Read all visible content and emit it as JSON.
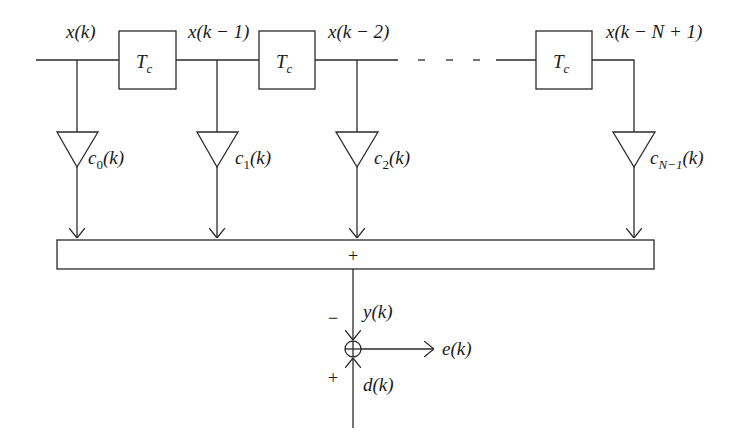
{
  "diagram": {
    "input_label": "x(k)",
    "delay_label": "T",
    "delay_sub": "c",
    "taps": [
      {
        "signal": "x(k)",
        "coef": "c",
        "coef_sub": "0",
        "coef_arg": "(k)"
      },
      {
        "signal": "x(k − 1)",
        "coef": "c",
        "coef_sub": "1",
        "coef_arg": "(k)"
      },
      {
        "signal": "x(k − 2)",
        "coef": "c",
        "coef_sub": "2",
        "coef_arg": "(k)"
      },
      {
        "signal": "x(k − N + 1)",
        "coef": "c",
        "coef_sub": "N−1",
        "coef_arg": "(k)"
      }
    ],
    "adder_label": "+",
    "output_label": "y(k)",
    "output_sign": "−",
    "desired_label": "d(k)",
    "desired_sign": "+",
    "error_label": "e(k)",
    "summer_symbol": "⊕"
  }
}
